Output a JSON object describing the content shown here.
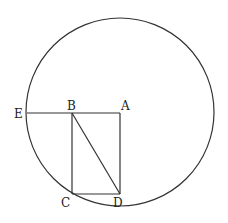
{
  "diagram": {
    "circle": {
      "cx": 120,
      "cy": 112,
      "r": 94
    },
    "points": {
      "A": {
        "label": "A",
        "x": 120,
        "y": 113
      },
      "B": {
        "label": "B",
        "x": 72,
        "y": 113
      },
      "C": {
        "label": "C",
        "x": 72,
        "y": 194
      },
      "D": {
        "label": "D",
        "x": 120,
        "y": 194
      },
      "E": {
        "label": "E",
        "x": 27,
        "y": 113
      }
    },
    "segments": [
      [
        "E",
        "A"
      ],
      [
        "A",
        "D"
      ],
      [
        "B",
        "C"
      ],
      [
        "C",
        "D"
      ],
      [
        "B",
        "D"
      ]
    ]
  }
}
